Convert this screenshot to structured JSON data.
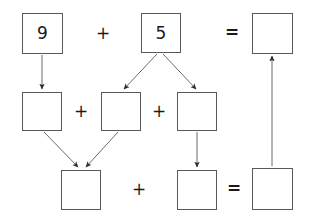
{
  "diagram": {
    "boxes": [
      {
        "id": "top-addend-1",
        "value": "9",
        "x": 22,
        "y": 13,
        "w": 41,
        "h": 41,
        "filled": true
      },
      {
        "id": "top-addend-2",
        "value": "5",
        "x": 141,
        "y": 13,
        "w": 40,
        "h": 40,
        "filled": true
      },
      {
        "id": "top-sum",
        "value": "",
        "x": 252,
        "y": 13,
        "w": 41,
        "h": 41,
        "filled": false
      },
      {
        "id": "mid-part-1",
        "value": "",
        "x": 22,
        "y": 92,
        "w": 40,
        "h": 39,
        "filled": false
      },
      {
        "id": "mid-part-2",
        "value": "",
        "x": 101,
        "y": 92,
        "w": 40,
        "h": 39,
        "filled": false
      },
      {
        "id": "mid-part-3",
        "value": "",
        "x": 177,
        "y": 92,
        "w": 40,
        "h": 39,
        "filled": false
      },
      {
        "id": "bottom-part-1",
        "value": "",
        "x": 61,
        "y": 170,
        "w": 40,
        "h": 40,
        "filled": false
      },
      {
        "id": "bottom-part-2",
        "value": "",
        "x": 177,
        "y": 170,
        "w": 40,
        "h": 40,
        "filled": false
      },
      {
        "id": "bottom-sum",
        "value": "",
        "x": 252,
        "y": 168,
        "w": 41,
        "h": 42,
        "filled": false
      }
    ],
    "operators": [
      {
        "id": "op-top-plus",
        "symbol": "+",
        "x": 96,
        "y": 25,
        "kind": "plus"
      },
      {
        "id": "op-top-equals",
        "symbol": "=",
        "x": 225,
        "y": 24,
        "kind": "equals"
      },
      {
        "id": "op-mid-plus-1",
        "symbol": "+",
        "x": 74,
        "y": 103,
        "kind": "plus"
      },
      {
        "id": "op-mid-plus-2",
        "symbol": "+",
        "x": 152,
        "y": 103,
        "kind": "plus"
      },
      {
        "id": "op-bottom-plus",
        "symbol": "+",
        "x": 132,
        "y": 181,
        "kind": "plus"
      },
      {
        "id": "op-bottom-equals",
        "symbol": "=",
        "x": 227,
        "y": 180,
        "kind": "equals"
      }
    ],
    "arrows": [
      {
        "id": "arrow-9-to-mid-part-1",
        "x1": 42,
        "y1": 55,
        "x2": 42,
        "y2": 89
      },
      {
        "id": "arrow-5-to-mid-part-2",
        "x1": 157,
        "y1": 54,
        "x2": 124,
        "y2": 89
      },
      {
        "id": "arrow-5-to-mid-part-3",
        "x1": 163,
        "y1": 54,
        "x2": 196,
        "y2": 89
      },
      {
        "id": "arrow-mid-part-1-to-bottom",
        "x1": 44,
        "y1": 132,
        "x2": 78,
        "y2": 167
      },
      {
        "id": "arrow-mid-part-2-to-bottom",
        "x1": 118,
        "y1": 132,
        "x2": 86,
        "y2": 167
      },
      {
        "id": "arrow-mid-part-3-to-bottom",
        "x1": 197,
        "y1": 132,
        "x2": 197,
        "y2": 167
      },
      {
        "id": "arrow-bottom-sum-to-top-sum",
        "x1": 272,
        "y1": 166,
        "x2": 272,
        "y2": 56
      }
    ],
    "colors": {
      "stroke": "#58585a",
      "arrow": "#6b6b6d",
      "text": "#1a1a1a",
      "background": "#ffffff"
    }
  }
}
